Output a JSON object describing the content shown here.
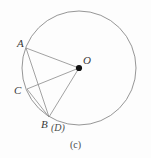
{
  "figure": {
    "caption": "(c)",
    "background_color": "#fdfdfd",
    "stroke_color": "#8a8a8a",
    "label_color": "#3a3a3a",
    "point_fill_color": "#111111",
    "labels": {
      "A": "A",
      "O": "O",
      "C": "C",
      "B": "B",
      "D": "(D)"
    },
    "circle": {
      "center_x": 79,
      "center_y": 68,
      "radius": 57
    },
    "points": [
      {
        "name": "A",
        "x": 26,
        "y": 48
      },
      {
        "name": "O",
        "x": 79,
        "y": 68
      },
      {
        "name": "C",
        "x": 27,
        "y": 89
      },
      {
        "name": "B",
        "x": 49,
        "y": 117
      }
    ],
    "segments": [
      {
        "from": "A",
        "to": "O"
      },
      {
        "from": "A",
        "to": "B"
      },
      {
        "from": "C",
        "to": "O"
      },
      {
        "from": "C",
        "to": "B"
      },
      {
        "from": "O",
        "to": "B"
      }
    ]
  }
}
